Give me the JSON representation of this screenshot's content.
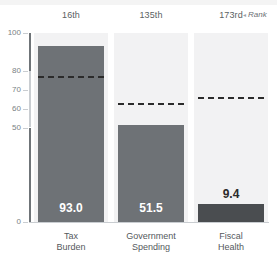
{
  "chart_data": {
    "type": "bar",
    "title": "",
    "subtitle": "",
    "xlabel": "",
    "ylabel": "",
    "ylim": [
      0,
      100
    ],
    "grid": false,
    "legend_position": "top-right",
    "categories": [
      "Tax Burden",
      "Government Spending",
      "Fiscal Health"
    ],
    "category_lines": [
      [
        "Tax",
        "Burden"
      ],
      [
        "Government",
        "Spending"
      ],
      [
        "Fiscal",
        "Health"
      ]
    ],
    "values": [
      93.0,
      51.5,
      9.4
    ],
    "value_labels": [
      "93.0",
      "51.5",
      "9.4"
    ],
    "ranks": [
      "16th",
      "135th",
      "173rd"
    ],
    "reference_lines": [
      77.0,
      63.0,
      66.0
    ],
    "y_ticks": [
      0,
      50,
      60,
      70,
      80,
      100
    ],
    "y_tick_labels": [
      "0",
      "50",
      "60",
      "70",
      "80",
      "100"
    ],
    "series": [
      {
        "name": "Score",
        "values": [
          93.0,
          51.5,
          9.4
        ]
      }
    ],
    "annotations": {
      "rank_legend": "Rank",
      "rank_legend_caret": "◂"
    },
    "colors": {
      "bar_default": "#6e7276",
      "bar_highlight": "#4a4d50",
      "column_background": "#f2f2f3",
      "reference_line": "#2b2b2b",
      "axis": "#c9cdd1",
      "axis_strong": "#6f7478",
      "tick_text": "#7a7f84",
      "category_text": "#55595d",
      "rank_text": "#5b5f63",
      "value_inside_text": "#ffffff",
      "value_above_text": "#2b2b2b",
      "page_background": "#ffffff"
    }
  }
}
